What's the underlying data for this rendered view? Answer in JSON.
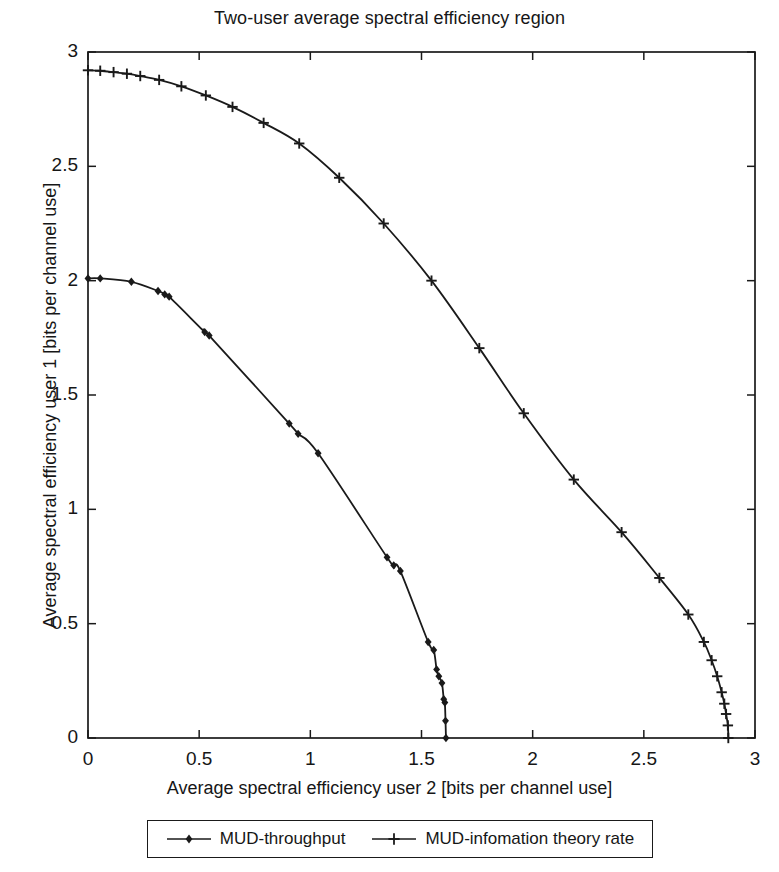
{
  "chart_data": {
    "type": "line",
    "title": "Two-user average spectral efficiency region",
    "xlabel": "Average spectral efficiency user 2 [bits per channel use]",
    "ylabel": "Average spectral efficiency user 1 [bits per channel use]",
    "xlim": [
      0,
      3
    ],
    "ylim": [
      0,
      3
    ],
    "xticks": [
      0,
      0.5,
      1,
      1.5,
      2,
      2.5,
      3
    ],
    "yticks": [
      0,
      0.5,
      1,
      1.5,
      2,
      2.5,
      3
    ],
    "xticklabels": [
      "0",
      "0.5",
      "1",
      "1.5",
      "2",
      "2.5",
      "3"
    ],
    "yticklabels": [
      "0",
      "0.5",
      "1",
      "1.5",
      "2",
      "2.5",
      "3"
    ],
    "grid": false,
    "legend_position": "below-axes",
    "line_color": "#1a1a1a",
    "series": [
      {
        "name": "MUD-throughput",
        "marker": "diamond",
        "color": "#1a1a1a",
        "x": [
          0.0,
          0.055,
          0.195,
          0.315,
          0.345,
          0.365,
          0.525,
          0.545,
          0.905,
          0.945,
          1.035,
          1.345,
          1.375,
          1.405,
          1.53,
          1.555,
          1.568,
          1.578,
          1.592,
          1.6,
          1.605,
          1.608,
          1.61
        ],
        "y": [
          2.01,
          2.01,
          1.995,
          1.955,
          1.94,
          1.93,
          1.775,
          1.76,
          1.375,
          1.33,
          1.245,
          0.79,
          0.755,
          0.73,
          0.42,
          0.385,
          0.3,
          0.27,
          0.24,
          0.17,
          0.155,
          0.075,
          0.0
        ]
      },
      {
        "name": "MUD-infomation theory rate",
        "marker": "plus",
        "color": "#1a1a1a",
        "x": [
          0.0,
          0.055,
          0.115,
          0.175,
          0.235,
          0.32,
          0.42,
          0.53,
          0.65,
          0.79,
          0.95,
          1.13,
          1.33,
          1.545,
          1.76,
          1.96,
          2.185,
          2.4,
          2.57,
          2.7,
          2.77,
          2.805,
          2.83,
          2.85,
          2.862,
          2.87,
          2.878,
          2.88
        ],
        "y": [
          2.92,
          2.918,
          2.912,
          2.905,
          2.895,
          2.878,
          2.85,
          2.81,
          2.76,
          2.69,
          2.6,
          2.45,
          2.25,
          2.0,
          1.705,
          1.42,
          1.13,
          0.9,
          0.7,
          0.54,
          0.42,
          0.34,
          0.27,
          0.2,
          0.15,
          0.105,
          0.055,
          0.0
        ]
      }
    ]
  },
  "legend": {
    "entries": [
      {
        "label": "MUD-throughput",
        "marker": "diamond-marker-icon"
      },
      {
        "label": "MUD-infomation theory rate",
        "marker": "plus-marker-icon"
      }
    ]
  }
}
